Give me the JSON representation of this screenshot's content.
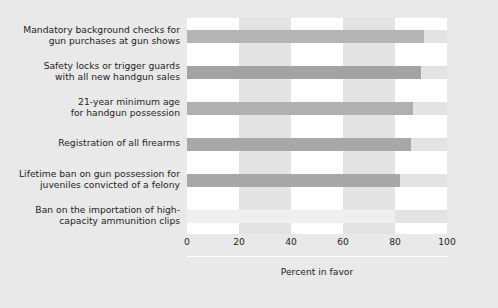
{
  "chart_data": {
    "type": "bar",
    "orientation": "horizontal",
    "title": "",
    "subtitle": "",
    "xlabel": "Percent in favor",
    "ylabel": "",
    "xlim": [
      0,
      100
    ],
    "ylim": null,
    "grid": false,
    "bands": true,
    "legend": null,
    "xticks": [
      0,
      20,
      40,
      60,
      80,
      100
    ],
    "xtick_labels": [
      "0",
      "20",
      "40",
      "60",
      "80",
      "100"
    ],
    "categories": [
      "Mandatory background checks for\ngun purchases at gun shows",
      "Safety locks or trigger guards\nwith all new handgun sales",
      "21-year minimum age\nfor handgun possession",
      "Registration of all firearms",
      "Lifetime ban on gun possession for\njuveniles convicted of a felony",
      "Ban on the importation of high-\ncapacity ammunition clips"
    ],
    "values": [
      91,
      90,
      87,
      86,
      82,
      80
    ],
    "bar_colors": [
      "#b4b4b4",
      "#a3a3a3",
      "#b0b0b0",
      "#a8a8a8",
      "#a8a8a8",
      "#efefef"
    ],
    "plot_background": "#ffffff",
    "band_color": "#e3e3e3",
    "figure_background": "#e9e9e9",
    "axis_color": "#ffffff",
    "text_color": "#1d1d1d"
  }
}
